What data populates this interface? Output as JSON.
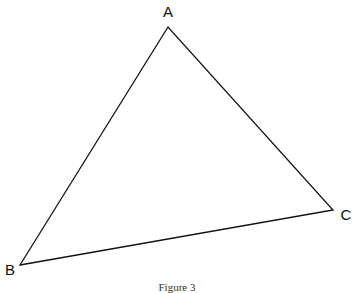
{
  "figure": {
    "caption": "Figure 3",
    "stroke_color": "#111111",
    "background": "#ffffff"
  },
  "triangle": {
    "vertices": [
      {
        "label": "A",
        "x": 168,
        "y": 27,
        "label_x": 168,
        "label_y": 17
      },
      {
        "label": "B",
        "x": 20,
        "y": 265,
        "label_x": 10,
        "label_y": 275
      },
      {
        "label": "C",
        "x": 333,
        "y": 210,
        "label_x": 346,
        "label_y": 220
      }
    ]
  }
}
